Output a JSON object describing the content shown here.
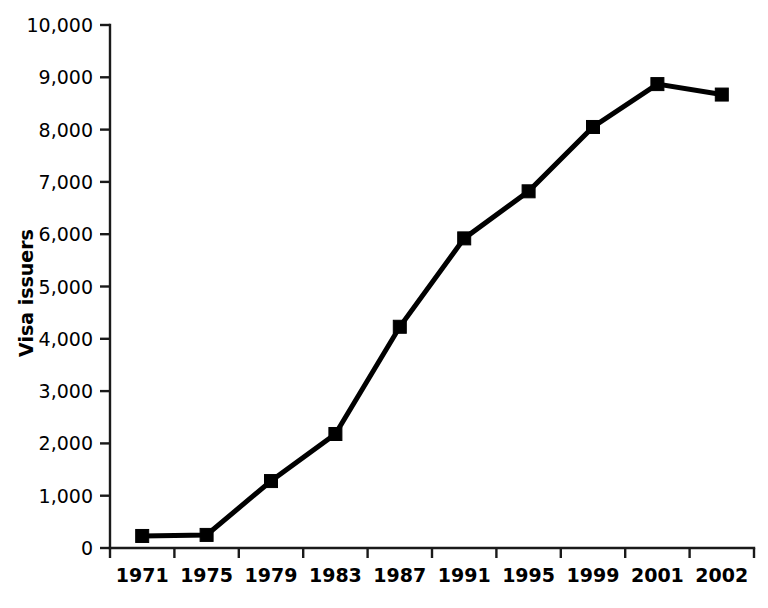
{
  "chart_data": {
    "type": "line",
    "title": "",
    "subtitle": "",
    "xlabel": "",
    "ylabel": "Visa issuers",
    "categories": [
      "1971",
      "1975",
      "1979",
      "1983",
      "1987",
      "1991",
      "1995",
      "1999",
      "2001",
      "2002"
    ],
    "values": [
      230,
      250,
      1280,
      2180,
      4230,
      5920,
      6820,
      8050,
      8870,
      8670
    ],
    "series": [
      {
        "name": "Visa issuers",
        "values": [
          230,
          250,
          1280,
          2180,
          4230,
          5920,
          6820,
          8050,
          8870,
          8670
        ]
      }
    ],
    "ylim": [
      0,
      10000
    ],
    "ytick_values": [
      0,
      1000,
      2000,
      3000,
      4000,
      5000,
      6000,
      7000,
      8000,
      9000,
      10000
    ],
    "ytick_labels": [
      "0",
      "1,000",
      "2,000",
      "3,000",
      "4,000",
      "5,000",
      "6,000",
      "7,000",
      "8,000",
      "9,000",
      "10,000"
    ],
    "xtick_labels": [
      "1971",
      "1975",
      "1979",
      "1983",
      "1987",
      "1991",
      "1995",
      "1999",
      "2001",
      "2002"
    ],
    "grid": false,
    "legend": false,
    "legend_position": "none",
    "marker": "square",
    "line_color": "#000000",
    "marker_color": "#000000",
    "background_color": "#ffffff",
    "axis_color": "#1a1a1a",
    "spines": [
      "left",
      "bottom"
    ],
    "annotations": []
  },
  "layout": {
    "plot_left": 110,
    "plot_right": 754,
    "plot_top": 25,
    "plot_bottom": 548,
    "tick_length": 10,
    "marker_size": 13
  }
}
